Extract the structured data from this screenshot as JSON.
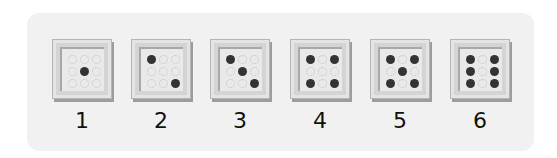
{
  "panel": {
    "background": "#f1f1f1"
  },
  "colors": {
    "dot_on": "#333333",
    "dot_off_outline": "#c2c2c2",
    "box": "#d4d4d4"
  },
  "dice": [
    {
      "label": "1",
      "pattern": [
        0,
        0,
        0,
        0,
        1,
        0,
        0,
        0,
        0
      ]
    },
    {
      "label": "2",
      "pattern": [
        1,
        0,
        0,
        0,
        0,
        0,
        0,
        0,
        1
      ]
    },
    {
      "label": "3",
      "pattern": [
        1,
        0,
        0,
        0,
        1,
        0,
        0,
        0,
        1
      ]
    },
    {
      "label": "4",
      "pattern": [
        1,
        0,
        1,
        0,
        0,
        0,
        1,
        0,
        1
      ]
    },
    {
      "label": "5",
      "pattern": [
        1,
        0,
        1,
        0,
        1,
        0,
        1,
        0,
        1
      ]
    },
    {
      "label": "6",
      "pattern": [
        1,
        0,
        1,
        1,
        0,
        1,
        1,
        0,
        1
      ]
    }
  ]
}
